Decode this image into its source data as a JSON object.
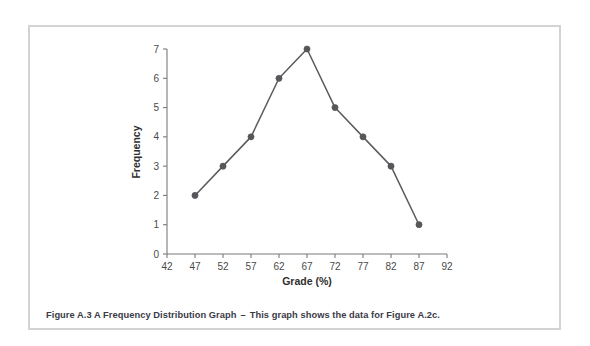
{
  "figure": {
    "caption_lead": "Figure A.3 A Frequency Distribution Graph",
    "caption_dash": "–",
    "caption_body": "This graph shows the data for Figure A.2c.",
    "border_color": "#d3d3d5",
    "background_color": "#ffffff"
  },
  "chart_data": {
    "type": "line",
    "title": "",
    "subtitle": "",
    "xlabel": "Grade (%)",
    "ylabel": "Frequency",
    "x": [
      47,
      52,
      57,
      62,
      67,
      72,
      77,
      82,
      87
    ],
    "values": [
      2,
      3,
      4,
      6,
      7,
      5,
      4,
      3,
      1
    ],
    "series": [
      {
        "name": "Frequency",
        "x": [
          47,
          52,
          57,
          62,
          67,
          72,
          77,
          82,
          87
        ],
        "values": [
          2,
          3,
          4,
          6,
          7,
          5,
          4,
          3,
          1
        ]
      }
    ],
    "xlim": [
      42,
      92
    ],
    "ylim": [
      0,
      7
    ],
    "xticks": [
      42,
      47,
      52,
      57,
      62,
      67,
      72,
      77,
      82,
      87,
      92
    ],
    "xtick_labels": [
      "42",
      "47",
      "52",
      "57",
      "62",
      "67",
      "72",
      "77",
      "82",
      "87",
      "92"
    ],
    "yticks": [
      0,
      1,
      2,
      3,
      4,
      5,
      6,
      7
    ],
    "ytick_labels": [
      "0",
      "1",
      "2",
      "3",
      "4",
      "5",
      "6",
      "7"
    ],
    "grid": false,
    "legend": false,
    "legend_position": "none",
    "marker": "circle",
    "line_color": "#5b5b5f",
    "marker_color": "#57575b",
    "axis_color": "#7a7a7a",
    "annotations": []
  }
}
